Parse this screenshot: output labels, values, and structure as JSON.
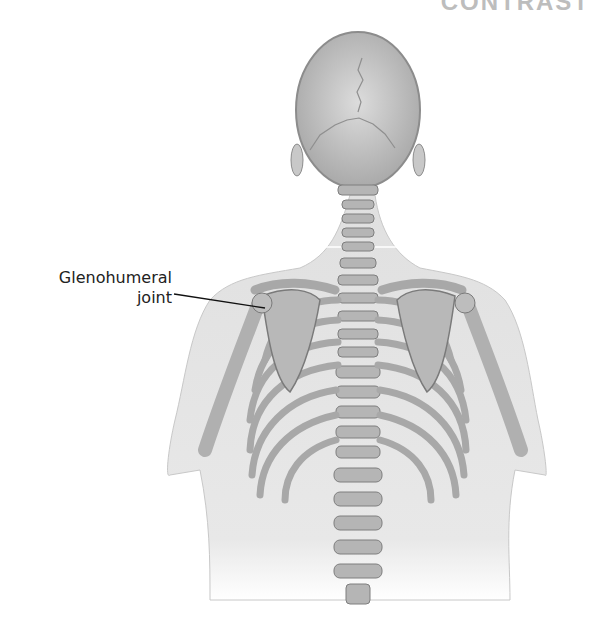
{
  "header": {
    "clipped_title": "CONTRAST"
  },
  "figure": {
    "labels": [
      {
        "line1": "Glenohumeral",
        "line2": "joint",
        "target": "left shoulder joint"
      }
    ]
  },
  "colors": {
    "bone": "#b9b9b9",
    "bone_outline": "#7a7a7a",
    "skin": "#e3e3e3",
    "background": "#ffffff",
    "label_text": "#222222"
  }
}
